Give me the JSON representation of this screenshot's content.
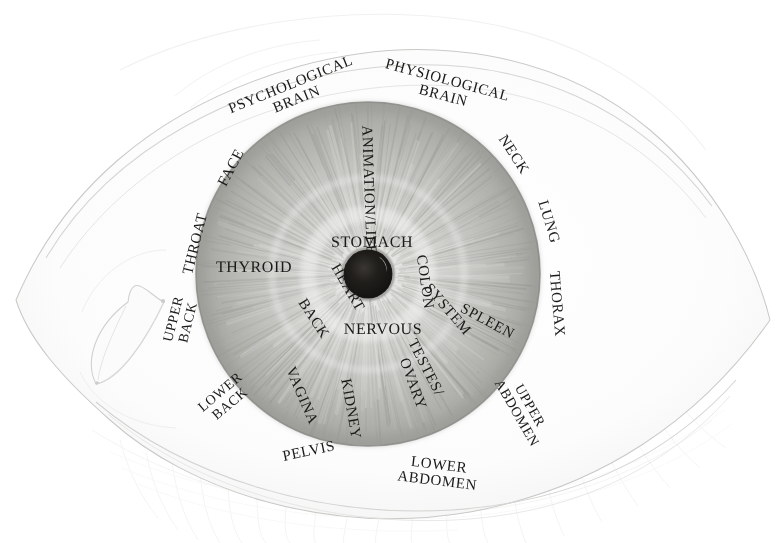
{
  "document": {
    "kind": "iridology-chart",
    "title": "Iridology Eye Chart",
    "medium": "pencil drawing",
    "background_color": "#ffffff",
    "ink_color": "#1a1a18"
  },
  "eye": {
    "sclera_label": "sclera",
    "iris_label": "iris",
    "pupil_label": "pupil",
    "caruncle_label": "tear-duct",
    "upper_lashes_label": "upper-eyelashes",
    "lower_lashes_label": "lower-eyelashes"
  },
  "chart_data": {
    "type": "pie",
    "xlabel": "",
    "ylabel": "",
    "center_label": "pupil",
    "inner_ring_name": "inner zone",
    "outer_ring_name": "outer zone",
    "categories": [
      "ANIMATION/LIFE",
      "STOMACH",
      "COLON",
      "SYSTEM",
      "NERVOUS",
      "HEART",
      "BACK",
      "THYROID",
      "VAGINA",
      "KIDNEY",
      "TESTES/",
      "OVARY",
      "SPLEEN",
      "PSYCHOLOGICAL BRAIN",
      "PHYSIOLOGICAL BRAIN",
      "FACE",
      "NECK",
      "THROAT",
      "LUNG",
      "THORAX",
      "UPPER BACK",
      "LOWER BACK",
      "PELVIS",
      "LOWER ABDOMEN",
      "UPPER ABDOMEN"
    ],
    "values": [
      1,
      1,
      1,
      1,
      1,
      1,
      1,
      1,
      1,
      1,
      1,
      1,
      1,
      1,
      1,
      1,
      1,
      1,
      1,
      1,
      1,
      1,
      1,
      1,
      1
    ],
    "legend_position": "none",
    "grid": false
  },
  "labels": {
    "inner": [
      {
        "id": "animation-life",
        "text": "ANIMATION/LIFE",
        "ring": "inner",
        "x": 368,
        "y": 190,
        "rotate": 88,
        "size": 15,
        "lines": 1
      },
      {
        "id": "stomach",
        "text": "STOMACH",
        "ring": "inner",
        "x": 372,
        "y": 243,
        "rotate": 0,
        "size": 16,
        "lines": 1
      },
      {
        "id": "colon",
        "text": "COLON",
        "ring": "inner",
        "x": 424,
        "y": 282,
        "rotate": 82,
        "size": 15,
        "lines": 1
      },
      {
        "id": "system",
        "text": "SYSTEM",
        "ring": "inner",
        "x": 447,
        "y": 310,
        "rotate": 49,
        "size": 15,
        "lines": 1
      },
      {
        "id": "nervous",
        "text": "NERVOUS",
        "ring": "inner",
        "x": 383,
        "y": 330,
        "rotate": 0,
        "size": 16,
        "lines": 1
      },
      {
        "id": "heart",
        "text": "HEART",
        "ring": "inner",
        "x": 347,
        "y": 288,
        "rotate": 60,
        "size": 15,
        "lines": 1
      },
      {
        "id": "back",
        "text": "BACK",
        "ring": "inner",
        "x": 313,
        "y": 319,
        "rotate": 57,
        "size": 15,
        "lines": 1
      },
      {
        "id": "thyroid",
        "text": "THYROID",
        "ring": "inner",
        "x": 254,
        "y": 268,
        "rotate": 0,
        "size": 16,
        "lines": 1
      },
      {
        "id": "vagina",
        "text": "VAGINA",
        "ring": "inner",
        "x": 301,
        "y": 396,
        "rotate": 67,
        "size": 15,
        "lines": 1
      },
      {
        "id": "kidney",
        "text": "KIDNEY",
        "ring": "inner",
        "x": 350,
        "y": 409,
        "rotate": 80,
        "size": 15,
        "lines": 1
      },
      {
        "id": "testes",
        "text": "TESTES/",
        "ring": "inner",
        "x": 425,
        "y": 368,
        "rotate": 63,
        "size": 15,
        "lines": 1
      },
      {
        "id": "ovary",
        "text": "OVARY",
        "ring": "inner",
        "x": 412,
        "y": 384,
        "rotate": 70,
        "size": 15,
        "lines": 1
      },
      {
        "id": "spleen",
        "text": "SPLEEN",
        "ring": "inner",
        "x": 487,
        "y": 322,
        "rotate": 28,
        "size": 15,
        "lines": 1
      }
    ],
    "outer": [
      {
        "id": "psychological-brain",
        "text": "PSYCHOLOGICAL",
        "text2": "BRAIN",
        "ring": "outer",
        "x": 294,
        "y": 93,
        "rotate": -22,
        "size": 15,
        "lines": 2
      },
      {
        "id": "physiological-brain",
        "text": "PHYSIOLOGICAL",
        "text2": "BRAIN",
        "ring": "outer",
        "x": 445,
        "y": 89,
        "rotate": 15,
        "size": 15,
        "lines": 2
      },
      {
        "id": "face",
        "text": "FACE",
        "ring": "outer",
        "x": 232,
        "y": 168,
        "rotate": -62,
        "size": 15,
        "lines": 1
      },
      {
        "id": "neck",
        "text": "NECK",
        "ring": "outer",
        "x": 513,
        "y": 155,
        "rotate": 57,
        "size": 15,
        "lines": 1
      },
      {
        "id": "throat",
        "text": "THROAT",
        "ring": "outer",
        "x": 196,
        "y": 244,
        "rotate": -76,
        "size": 15,
        "lines": 1
      },
      {
        "id": "lung",
        "text": "LUNG",
        "ring": "outer",
        "x": 548,
        "y": 222,
        "rotate": 73,
        "size": 15,
        "lines": 1
      },
      {
        "id": "thorax",
        "text": "THORAX",
        "ring": "outer",
        "x": 556,
        "y": 304,
        "rotate": 85,
        "size": 15,
        "lines": 1
      },
      {
        "id": "upper-back",
        "text": "UPPER",
        "text2": "BACK",
        "ring": "outer",
        "x": 182,
        "y": 321,
        "rotate": -76,
        "size": 14,
        "lines": 2
      },
      {
        "id": "lower-back",
        "text": "LOWER",
        "text2": "BACK",
        "ring": "outer",
        "x": 226,
        "y": 399,
        "rotate": -40,
        "size": 14,
        "lines": 2
      },
      {
        "id": "pelvis",
        "text": "PELVIS",
        "ring": "outer",
        "x": 309,
        "y": 452,
        "rotate": -12,
        "size": 15,
        "lines": 1
      },
      {
        "id": "lower-abdomen",
        "text": "LOWER",
        "text2": "ABDOMEN",
        "ring": "outer",
        "x": 438,
        "y": 474,
        "rotate": 7,
        "size": 15,
        "lines": 2
      },
      {
        "id": "upper-abdomen",
        "text": "UPPER",
        "text2": "ABDOMEN",
        "ring": "outer",
        "x": 522,
        "y": 410,
        "rotate": 60,
        "size": 14,
        "lines": 2
      }
    ]
  }
}
